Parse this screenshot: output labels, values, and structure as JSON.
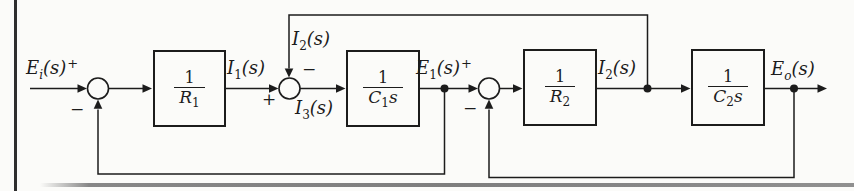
{
  "figure": {
    "type": "control-system-block-diagram",
    "background": "#fbfbf9",
    "ink": "#1c1c1c"
  },
  "blocks": [
    {
      "num": "1",
      "den_base": "R",
      "den_sub": "1",
      "den_suffix": ""
    },
    {
      "num": "1",
      "den_base": "C",
      "den_sub": "1",
      "den_suffix": "s"
    },
    {
      "num": "1",
      "den_base": "R",
      "den_sub": "2",
      "den_suffix": ""
    },
    {
      "num": "1",
      "den_base": "C",
      "den_sub": "2",
      "den_suffix": "s"
    }
  ],
  "signals": {
    "ei": {
      "base": "E",
      "sub": "i",
      "args": "(s)",
      "sign": "+"
    },
    "i1": {
      "base": "I",
      "sub": "1",
      "args": "(s)"
    },
    "i2_top": {
      "base": "I",
      "sub": "2",
      "args": "(s)"
    },
    "i3": {
      "base": "I",
      "sub": "3",
      "args": "(s)"
    },
    "e1": {
      "base": "E",
      "sub": "1",
      "args": "(s)",
      "sign": "+"
    },
    "i2_mid": {
      "base": "I",
      "sub": "2",
      "args": "(s)"
    },
    "eo": {
      "base": "E",
      "sub": "o",
      "args": "(s)"
    }
  },
  "signs": {
    "j1_minus": "−",
    "j2_minus": "−",
    "j2_plus": "+",
    "j3_minus": "−"
  }
}
